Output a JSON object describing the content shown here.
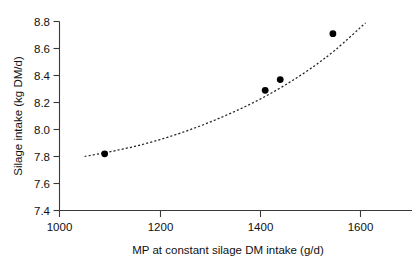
{
  "chart_data": {
    "type": "scatter",
    "title": "",
    "xlabel": "MP at constant silage DM intake (g/d)",
    "ylabel": "Silage intake (kg DM/d)",
    "xlim": [
      1000,
      1660
    ],
    "ylim": [
      7.4,
      8.8
    ],
    "xticks": [
      1000,
      1200,
      1400,
      1600
    ],
    "xtick_labels": [
      "1000",
      "1200",
      "1400",
      "1600"
    ],
    "yticks": [
      7.4,
      7.6,
      7.8,
      8.0,
      8.2,
      8.4,
      8.6,
      8.8
    ],
    "ytick_labels": [
      "7.4",
      "7.6",
      "7.8",
      "8.0",
      "8.2",
      "8.4",
      "8.6",
      "8.8"
    ],
    "grid": false,
    "legend": false,
    "legend_position": "none",
    "series": [
      {
        "name": "Observed silage intake",
        "marker": "filled-circle",
        "marker_color": "#000000",
        "x": [
          1090,
          1410,
          1440,
          1545
        ],
        "y": [
          7.82,
          8.29,
          8.37,
          8.71
        ]
      },
      {
        "name": "Fitted response curve",
        "style": "dashed",
        "line_color": "#222222",
        "x": [
          1050,
          1100,
          1150,
          1200,
          1250,
          1300,
          1350,
          1400,
          1450,
          1500,
          1550,
          1610
        ],
        "y": [
          7.8,
          7.835,
          7.875,
          7.925,
          7.985,
          8.055,
          8.135,
          8.225,
          8.33,
          8.45,
          8.59,
          8.79
        ]
      }
    ],
    "annotations": []
  },
  "axes": {
    "y_title": "Silage intake (kg DM/d)",
    "x_title": "MP at constant silage DM intake (g/d)"
  },
  "y_tick_labels": [
    "8.8",
    "8.6",
    "8.4",
    "8.2",
    "8.0",
    "7.8",
    "7.6",
    "7.4"
  ],
  "x_tick_labels": [
    "1000",
    "1200",
    "1400",
    "1600"
  ]
}
